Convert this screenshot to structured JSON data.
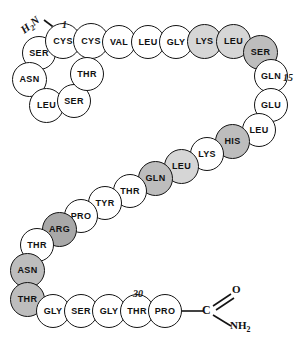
{
  "figure": {
    "type": "peptide-sequence-diagram",
    "title": "",
    "background": "#ffffff",
    "outline_color": "#141414",
    "fills": {
      "white": "#ffffff",
      "light": "#d6d6d6",
      "medium": "#bdbdbd",
      "dark": "#a8a8a8"
    },
    "n_terminus": {
      "label_main": "H",
      "label_sub": "2",
      "label_tail": "N"
    },
    "c_terminus": {
      "carbon": "C",
      "oxygen": "O",
      "amide": "NH",
      "amide_sub": "2"
    },
    "position_markers": [
      {
        "label": "1",
        "x": 62,
        "y": 19
      },
      {
        "label": "15",
        "x": 283,
        "y": 72
      },
      {
        "label": "30",
        "x": 133,
        "y": 288
      }
    ],
    "residues": [
      {
        "name": "SER",
        "x": 22,
        "y": 36,
        "d": 34,
        "fill": "white",
        "fs": 9
      },
      {
        "name": "CYS",
        "x": 45,
        "y": 23,
        "d": 36,
        "fill": "white",
        "fs": 9
      },
      {
        "name": "CYS",
        "x": 73,
        "y": 23,
        "d": 36,
        "fill": "white",
        "fs": 9
      },
      {
        "name": "VAL",
        "x": 102,
        "y": 25,
        "d": 34,
        "fill": "white",
        "fs": 9
      },
      {
        "name": "LEU",
        "x": 131,
        "y": 25,
        "d": 34,
        "fill": "white",
        "fs": 9
      },
      {
        "name": "GLY",
        "x": 159,
        "y": 25,
        "d": 34,
        "fill": "white",
        "fs": 9
      },
      {
        "name": "LYS",
        "x": 187,
        "y": 24,
        "d": 35,
        "fill": "light",
        "fs": 9
      },
      {
        "name": "LEU",
        "x": 216,
        "y": 24,
        "d": 35,
        "fill": "light",
        "fs": 9
      },
      {
        "name": "SER",
        "x": 243,
        "y": 35,
        "d": 35,
        "fill": "medium",
        "fs": 9
      },
      {
        "name": "GLN",
        "x": 254,
        "y": 59,
        "d": 34,
        "fill": "white",
        "fs": 9
      },
      {
        "name": "GLU",
        "x": 254,
        "y": 88,
        "d": 34,
        "fill": "white",
        "fs": 9
      },
      {
        "name": "LEU",
        "x": 242,
        "y": 113,
        "d": 34,
        "fill": "white",
        "fs": 9
      },
      {
        "name": "HIS",
        "x": 215,
        "y": 124,
        "d": 35,
        "fill": "medium",
        "fs": 9
      },
      {
        "name": "LYS",
        "x": 190,
        "y": 137,
        "d": 34,
        "fill": "white",
        "fs": 9
      },
      {
        "name": "LEU",
        "x": 164,
        "y": 149,
        "d": 35,
        "fill": "light",
        "fs": 9
      },
      {
        "name": "GLN",
        "x": 138,
        "y": 161,
        "d": 35,
        "fill": "medium",
        "fs": 9
      },
      {
        "name": "THR",
        "x": 113,
        "y": 174,
        "d": 34,
        "fill": "white",
        "fs": 9
      },
      {
        "name": "TYR",
        "x": 88,
        "y": 186,
        "d": 34,
        "fill": "white",
        "fs": 9
      },
      {
        "name": "PRO",
        "x": 64,
        "y": 199,
        "d": 34,
        "fill": "white",
        "fs": 9
      },
      {
        "name": "ARG",
        "x": 42,
        "y": 212,
        "d": 35,
        "fill": "dark",
        "fs": 9
      },
      {
        "name": "THR",
        "x": 20,
        "y": 228,
        "d": 34,
        "fill": "white",
        "fs": 9
      },
      {
        "name": "ASN",
        "x": 10,
        "y": 253,
        "d": 35,
        "fill": "medium",
        "fs": 9
      },
      {
        "name": "THR",
        "x": 10,
        "y": 282,
        "d": 35,
        "fill": "medium",
        "fs": 9
      },
      {
        "name": "GLY",
        "x": 36,
        "y": 294,
        "d": 34,
        "fill": "white",
        "fs": 9
      },
      {
        "name": "SER",
        "x": 64,
        "y": 294,
        "d": 34,
        "fill": "white",
        "fs": 9
      },
      {
        "name": "GLY",
        "x": 92,
        "y": 294,
        "d": 34,
        "fill": "white",
        "fs": 9
      },
      {
        "name": "THR",
        "x": 120,
        "y": 294,
        "d": 34,
        "fill": "white",
        "fs": 9
      },
      {
        "name": "PRO",
        "x": 148,
        "y": 294,
        "d": 34,
        "fill": "white",
        "fs": 9
      },
      {
        "name": "ASN",
        "x": 12,
        "y": 62,
        "d": 35,
        "fill": "white",
        "fs": 9
      },
      {
        "name": "LEU",
        "x": 29,
        "y": 88,
        "d": 35,
        "fill": "white",
        "fs": 9
      },
      {
        "name": "SER",
        "x": 57,
        "y": 84,
        "d": 34,
        "fill": "white",
        "fs": 9
      },
      {
        "name": "THR",
        "x": 70,
        "y": 57,
        "d": 34,
        "fill": "white",
        "fs": 9
      }
    ]
  }
}
